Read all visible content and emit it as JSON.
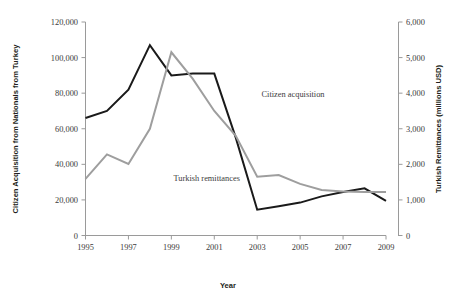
{
  "chart_data": {
    "type": "line",
    "title": "",
    "xlabel": "Year",
    "ylabel": "Citizen Acquisition from Nationals from Turkey",
    "y2label": "Turkish Remittances (millions USD)",
    "x": [
      1995,
      1996,
      1997,
      1998,
      1999,
      2000,
      2001,
      2002,
      2003,
      2004,
      2005,
      2006,
      2007,
      2008,
      2009
    ],
    "xlim": [
      1995,
      2009
    ],
    "xticks": [
      "1995",
      "1997",
      "1999",
      "2001",
      "2003",
      "2005",
      "2007",
      "2009"
    ],
    "xtick_values": [
      1995,
      1997,
      1999,
      2001,
      2003,
      2005,
      2007,
      2009
    ],
    "ylim": [
      0,
      120000
    ],
    "yticks": [
      "0",
      "20,000",
      "40,000",
      "60,000",
      "80,000",
      "100,000",
      "120,000"
    ],
    "ytick_values": [
      0,
      20000,
      40000,
      60000,
      80000,
      100000,
      120000
    ],
    "y2lim": [
      0,
      6000
    ],
    "y2ticks": [
      "0",
      "1,000",
      "2,000",
      "3,000",
      "4,000",
      "5,000",
      "6,000"
    ],
    "y2tick_values": [
      0,
      1000,
      2000,
      3000,
      4000,
      5000,
      6000
    ],
    "grid": false,
    "legend_position": "inline-labels",
    "series": [
      {
        "name": "Citizen acquisition",
        "axis": "left",
        "color": "#1a1a1a",
        "label_x": 2003.2,
        "label_y": 78000,
        "values": [
          66000,
          70000,
          82000,
          107000,
          90000,
          91000,
          91000,
          55000,
          14500,
          16500,
          18500,
          22000,
          24500,
          26500,
          19500
        ]
      },
      {
        "name": "Turkish remittances",
        "axis": "right",
        "color": "#9e9e9e",
        "label_x": 1999.1,
        "label_y": 1530,
        "values": [
          1590,
          2280,
          2010,
          3000,
          5150,
          4400,
          3500,
          2800,
          1650,
          1700,
          1450,
          1280,
          1240,
          1220,
          1220
        ]
      }
    ]
  },
  "labels": {
    "y_axis_title": "Citizen Acquisition from Nationals from Turkey",
    "y2_axis_title": "Turkish Remittances (millions USD)",
    "x_axis_title": "Year",
    "series_citizen": "Citizen acquisition",
    "series_remittances": "Turkish remittances"
  }
}
